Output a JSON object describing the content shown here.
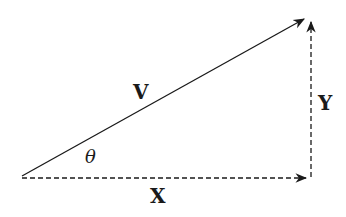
{
  "diagram": {
    "type": "vector-decomposition",
    "vectors": [
      {
        "id": "V",
        "label": "V",
        "style": "solid",
        "from": [
          22,
          176
        ],
        "to": [
          306,
          18
        ]
      },
      {
        "id": "X",
        "label": "X",
        "style": "dashed",
        "from": [
          22,
          178
        ],
        "to": [
          308,
          178
        ]
      },
      {
        "id": "Y",
        "label": "Y",
        "style": "dashed",
        "from": [
          311,
          177
        ],
        "to": [
          311,
          20
        ]
      }
    ],
    "angle_label": "θ",
    "labels": {
      "V": "V",
      "X": "X",
      "Y": "Y",
      "theta": "θ"
    },
    "colors": {
      "stroke": "#1a1a1a",
      "background": "#ffffff"
    }
  }
}
